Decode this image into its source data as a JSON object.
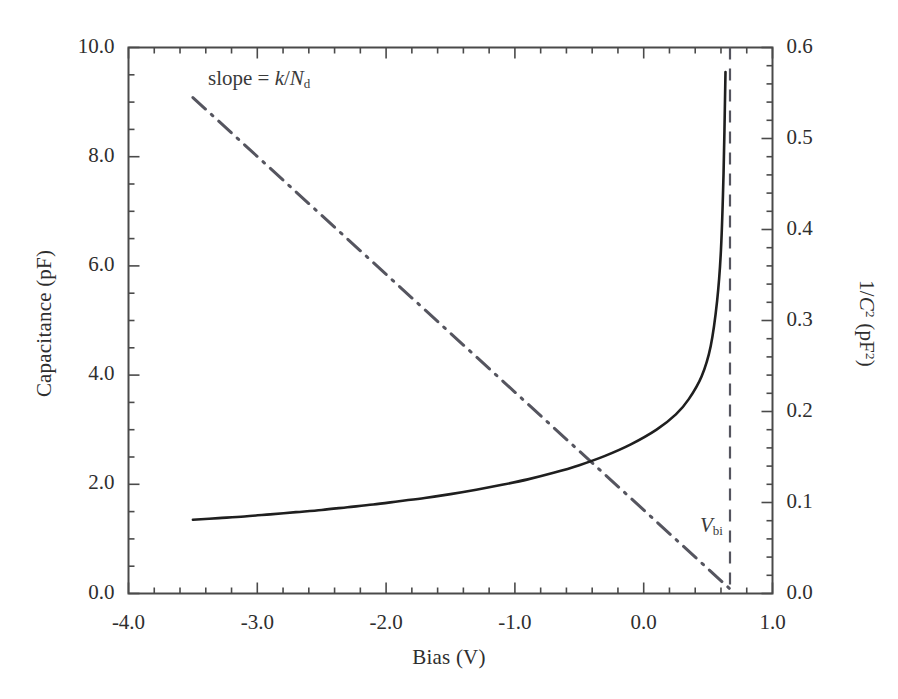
{
  "figure": {
    "background_color": "#ffffff",
    "frame_color": "#4a4a4a",
    "curve_color": "#1f1f1f",
    "aux_line_color": "#55555f"
  },
  "axes": {
    "x": {
      "title": "Bias (V)",
      "ticks": [
        "-4.0",
        "-3.0",
        "-2.0",
        "-1.0",
        "0.0",
        "1.0"
      ],
      "tick_values": [
        -4.0,
        -3.0,
        -2.0,
        -1.0,
        0.0,
        1.0
      ],
      "min": -4.0,
      "max": 1.0,
      "minor_per_major": 5
    },
    "y_left": {
      "title_prefix": "Capacitance (pF)",
      "ticks": [
        "0.0",
        "2.0",
        "4.0",
        "6.0",
        "8.0",
        "10.0"
      ],
      "tick_values": [
        0.0,
        2.0,
        4.0,
        6.0,
        8.0,
        10.0
      ],
      "min": 0.0,
      "max": 10.0,
      "minor_per_major": 4
    },
    "y_right": {
      "title_main": "1/",
      "title_var": "C",
      "title_exp": "2",
      "title_units_open": " (pF",
      "title_units_exp": "2",
      "title_units_close": ")",
      "ticks": [
        "0.0",
        "0.1",
        "0.2",
        "0.3",
        "0.4",
        "0.5",
        "0.6"
      ],
      "tick_values": [
        0.0,
        0.1,
        0.2,
        0.3,
        0.4,
        0.5,
        0.6
      ],
      "min": 0.0,
      "max": 0.6,
      "minor_per_major": 5
    }
  },
  "annotations": {
    "slope": {
      "text_prefix": "slope = ",
      "var_k": "k",
      "divider": "/",
      "var_N": "N",
      "sub_d": "d"
    },
    "vbi": {
      "var_V": "V",
      "sub_bi": "bi",
      "x_value": 0.67
    }
  },
  "chart_data": {
    "type": "line",
    "title": "",
    "xlabel": "Bias (V)",
    "ylabel": "Capacitance (pF)",
    "ylabel_right": "1/C^2 (pF^2)",
    "xlim": [
      -4.0,
      1.0
    ],
    "ylim": [
      0.0,
      10.0
    ],
    "ylim_right": [
      0.0,
      0.6
    ],
    "grid": false,
    "legend": false,
    "series": [
      {
        "name": "Capacitance",
        "axis": "left",
        "style": "solid",
        "color": "#1f1f1f",
        "x": [
          -3.5,
          -3.3,
          -3.1,
          -2.9,
          -2.7,
          -2.5,
          -2.3,
          -2.1,
          -1.9,
          -1.7,
          -1.5,
          -1.3,
          -1.1,
          -0.9,
          -0.7,
          -0.5,
          -0.3,
          -0.1,
          0.1,
          0.25,
          0.35,
          0.45,
          0.52,
          0.57,
          0.6,
          0.62,
          0.635
        ],
        "y": [
          1.35,
          1.38,
          1.41,
          1.45,
          1.49,
          1.53,
          1.58,
          1.63,
          1.69,
          1.75,
          1.82,
          1.9,
          1.99,
          2.09,
          2.21,
          2.35,
          2.52,
          2.73,
          3.0,
          3.28,
          3.56,
          3.98,
          4.53,
          5.36,
          6.3,
          7.7,
          9.55
        ]
      },
      {
        "name": "1/C^2",
        "axis": "right",
        "style": "dash-dot",
        "color": "#55555f",
        "x": [
          -3.5,
          0.67
        ],
        "y": [
          0.545,
          0.005
        ]
      }
    ],
    "vertical_lines": [
      {
        "name": "V_bi",
        "x": 0.67,
        "style": "dashed",
        "color": "#55555f",
        "label": "V_bi"
      }
    ],
    "annotations": [
      {
        "text": "slope = k/N_d",
        "x": -2.55,
        "y_right": 0.555
      }
    ]
  }
}
